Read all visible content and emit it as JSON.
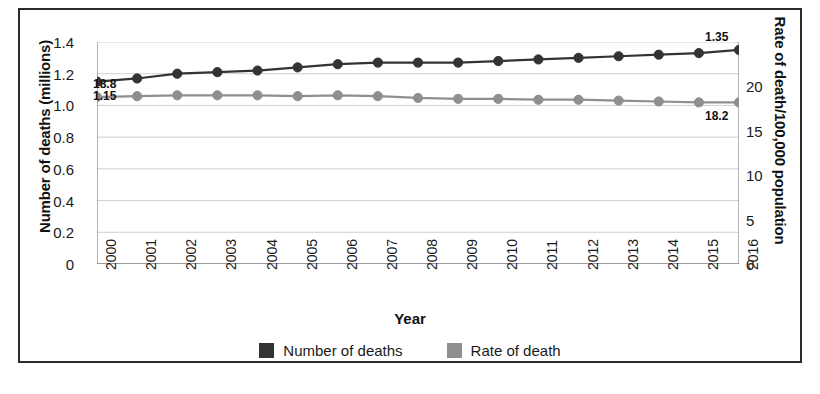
{
  "chart_data": {
    "type": "line",
    "title": "",
    "xlabel": "Year",
    "ylabel": "Number of deaths (millions)",
    "ylabel_right": "Rate of death/100,000 population",
    "grid": true,
    "legend_position": "bottom",
    "categories": [
      "2000",
      "2001",
      "2002",
      "2003",
      "2004",
      "2005",
      "2006",
      "2007",
      "2008",
      "2009",
      "2010",
      "2011",
      "2012",
      "2013",
      "2014",
      "2015",
      "2016"
    ],
    "ylim": [
      0,
      1.4
    ],
    "ylim_right": [
      0,
      25
    ],
    "yticks": [
      "1.4",
      "1.2",
      "1.0",
      "0.8",
      "0.6",
      "0.4",
      "0.2",
      "0"
    ],
    "yticks_right": [
      "20",
      "15",
      "10",
      "5",
      "0"
    ],
    "series": [
      {
        "name": "Number of deaths",
        "axis": "left",
        "color": "#333333",
        "values": [
          1.15,
          1.17,
          1.2,
          1.21,
          1.22,
          1.24,
          1.26,
          1.27,
          1.27,
          1.27,
          1.28,
          1.29,
          1.3,
          1.31,
          1.32,
          1.33,
          1.35
        ]
      },
      {
        "name": "Rate of death",
        "axis": "right",
        "color": "#8f8f8f",
        "values": [
          18.8,
          18.9,
          19.0,
          19.0,
          19.0,
          18.9,
          19.0,
          18.9,
          18.7,
          18.6,
          18.6,
          18.5,
          18.5,
          18.4,
          18.3,
          18.2,
          18.2
        ]
      }
    ],
    "annotations": [
      {
        "text": "18.8",
        "series": "Rate of death",
        "index": 0
      },
      {
        "text": "1.15",
        "series": "Number of deaths",
        "index": 0
      },
      {
        "text": "1.35",
        "series": "Number of deaths",
        "index": 16
      },
      {
        "text": "18.2",
        "series": "Rate of death",
        "index": 16
      }
    ],
    "legend": [
      {
        "label": "Number of deaths",
        "color": "#333333"
      },
      {
        "label": "Rate of death",
        "color": "#8f8f8f"
      }
    ]
  }
}
